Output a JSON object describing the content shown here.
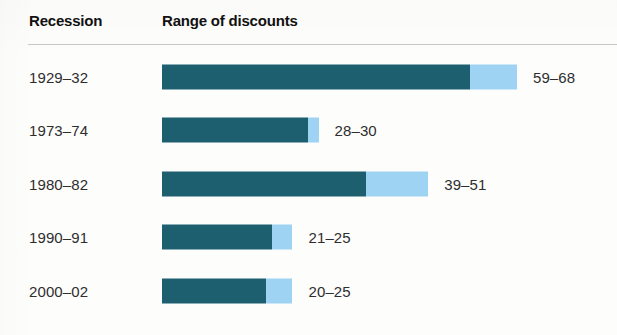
{
  "header": {
    "col_recession": "Recession",
    "col_range": "Range of discounts"
  },
  "colors": {
    "dark_segment": "#1d5f6e",
    "light_segment": "#9ed3f4",
    "text": "#2e2e2e",
    "rule": "#c9c9c4",
    "background": "#fdfdfc"
  },
  "chart_data": {
    "type": "bar",
    "title": "Range of discounts",
    "xlabel": "",
    "ylabel": "Recession",
    "categories": [
      "1929–32",
      "1973–74",
      "1980–82",
      "1990–91",
      "2000–02"
    ],
    "series": [
      {
        "name": "Low end of discount range",
        "values": [
          59,
          28,
          39,
          21,
          20
        ]
      },
      {
        "name": "High end of discount range",
        "values": [
          68,
          30,
          51,
          25,
          25
        ]
      }
    ],
    "value_labels": [
      "59–68",
      "28–30",
      "39–51",
      "21–25",
      "20–25"
    ],
    "xlim": [
      0,
      68
    ],
    "grid": false,
    "legend": "none"
  },
  "rows": [
    {
      "label": "1929–32",
      "low": 59,
      "high": 68,
      "value_label": "59–68"
    },
    {
      "label": "1973–74",
      "low": 28,
      "high": 30,
      "value_label": "28–30"
    },
    {
      "label": "1980–82",
      "low": 39,
      "high": 51,
      "value_label": "39–51"
    },
    {
      "label": "1990–91",
      "low": 21,
      "high": 25,
      "value_label": "21–25"
    },
    {
      "label": "2000–02",
      "low": 20,
      "high": 25,
      "value_label": "20–25"
    }
  ]
}
